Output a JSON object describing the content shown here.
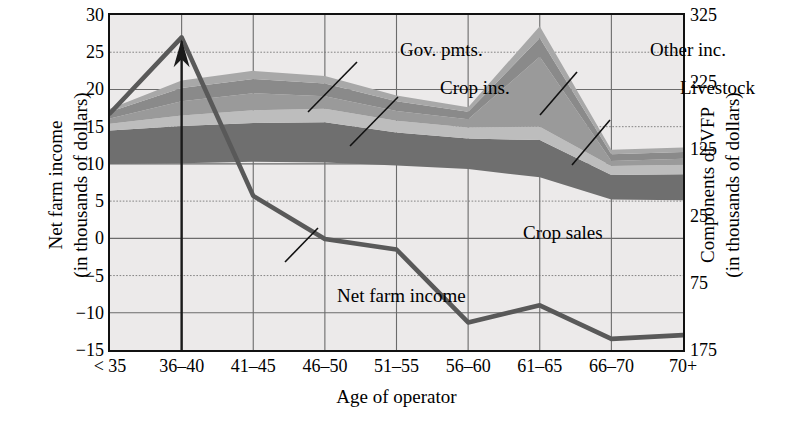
{
  "chart_data": {
    "type": "area",
    "title": "",
    "xlabel": "Age of operator",
    "ylabel_left": [
      "Net farm income",
      "(in thousands of dollars)"
    ],
    "ylabel_right": [
      "Components of VFP",
      "(in thousands of dollars)"
    ],
    "categories": [
      "< 35",
      "36–40",
      "41–45",
      "46–50",
      "51–55",
      "56–60",
      "61–65",
      "66–70",
      "70+"
    ],
    "ylim_left": [
      -15,
      30
    ],
    "ylim_right": [
      -175,
      325
    ],
    "yticks_left": [
      "30",
      "25",
      "20",
      "15",
      "10",
      "5",
      "0",
      "−5",
      "−10",
      "−15"
    ],
    "yticks_left_values": [
      30,
      25,
      20,
      15,
      10,
      5,
      0,
      -5,
      -10,
      -15
    ],
    "yticks_right": [
      "325",
      "225",
      "125",
      "25",
      "75",
      "175"
    ],
    "yticks_right_values": [
      325,
      225,
      125,
      25,
      -75,
      -175
    ],
    "grid": true,
    "legend_position": "inline-annotations",
    "series": [
      {
        "name": "Crop sales",
        "label": "Crop sales",
        "kind": "stacked-band",
        "color": "#6f6f6f",
        "baseline": [
          10.0,
          10.1,
          10.3,
          10.2,
          9.8,
          9.3,
          8.2,
          5.2,
          5.1
        ],
        "values": [
          4.5,
          5.0,
          5.2,
          5.4,
          4.4,
          4.1,
          5.0,
          3.3,
          3.5
        ]
      },
      {
        "name": "Livestock",
        "label": "Livestock",
        "kind": "stacked-band",
        "color": "#bdbdbd",
        "values": [
          0.9,
          1.4,
          1.7,
          1.8,
          1.6,
          1.5,
          1.8,
          1.2,
          1.3
        ]
      },
      {
        "name": "Crop ins.",
        "label": "Crop ins.",
        "kind": "stacked-band",
        "color": "#9a9a9a",
        "values": [
          0.7,
          1.9,
          2.3,
          1.7,
          1.3,
          1.1,
          9.4,
          0.7,
          0.8
        ]
      },
      {
        "name": "Gov. pmts.",
        "label": "Gov. pmts.",
        "kind": "stacked-band",
        "color": "#8a8a8a",
        "values": [
          0.9,
          1.8,
          1.9,
          1.7,
          1.3,
          1.0,
          2.5,
          0.9,
          0.9
        ]
      },
      {
        "name": "Other inc.",
        "label": "Other inc.",
        "kind": "stacked-band",
        "color": "#a8a8a8",
        "values": [
          0.4,
          1.0,
          1.1,
          1.0,
          0.8,
          0.6,
          1.6,
          0.6,
          0.6
        ]
      },
      {
        "name": "Net farm income",
        "label": "Net farm income",
        "kind": "line",
        "color": "#595959",
        "values": [
          16.8,
          27.0,
          5.7,
          -0.1,
          -1.5,
          -11.3,
          -9.0,
          -13.5,
          -13.0
        ]
      }
    ],
    "annotations": [
      {
        "text": "Gov. pmts.",
        "x": 290,
        "y": 24
      },
      {
        "text": "Crop ins.",
        "x": 330,
        "y": 62
      },
      {
        "text": "Other inc.",
        "x": 540,
        "y": 24
      },
      {
        "text": "Livestock",
        "x": 570,
        "y": 62
      },
      {
        "text": "Crop sales",
        "x": 413,
        "y": 207
      },
      {
        "text": "Net farm income",
        "x": 227,
        "y": 270
      }
    ]
  }
}
